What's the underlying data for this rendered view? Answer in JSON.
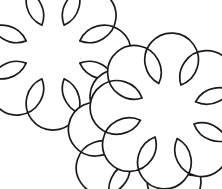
{
  "canvas": {
    "width": 222,
    "height": 189,
    "background_color": "#ffffff",
    "title": "Two clouds line drawing",
    "style": "line-art-outline"
  },
  "drawing": {
    "stroke_color": "#1a1a1a",
    "fill_color": "#ffffff",
    "stroke_width": 1.7,
    "shape_count": 3,
    "group_count": 2
  },
  "shapes": [
    {
      "id": "cloud-top-left",
      "label": "Cloud 1",
      "type": "scalloped-flower",
      "lobes": 8,
      "center_x": 53,
      "center_y": 52,
      "outer_radius": 39,
      "inner_radius": 29,
      "rotation_deg": 0,
      "z_index": 1
    },
    {
      "id": "cloud-bottom-right-back",
      "label": "Cloud 2 back petal cluster",
      "type": "scalloped-flower",
      "lobes": 8,
      "center_x": 145.5,
      "center_y": 139,
      "outer_radius": 39,
      "inner_radius": 29,
      "rotation_deg": 11,
      "z_index": 2
    },
    {
      "id": "cloud-bottom-right-front",
      "label": "Cloud 2 front petal cluster",
      "type": "scalloped-flower",
      "lobes": 8,
      "center_x": 168,
      "center_y": 111,
      "outer_radius": 39,
      "inner_radius": 29,
      "rotation_deg": 4,
      "z_index": 3
    }
  ]
}
